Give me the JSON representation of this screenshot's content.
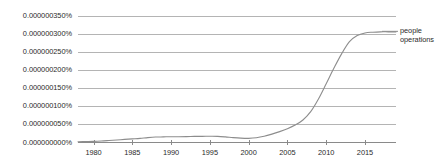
{
  "chart_data": {
    "type": "line",
    "title": "",
    "subtitle": "",
    "xlabel": "",
    "ylabel": "",
    "grid": true,
    "legend_position": "right-inline",
    "xlim": [
      1978,
      2019
    ],
    "ylim": [
      0.0,
      3.5e-07
    ],
    "x_ticks": [
      1980,
      1985,
      1990,
      1995,
      2000,
      2005,
      2010,
      2015
    ],
    "x_tick_labels": [
      "1980",
      "1985",
      "1990",
      "1995",
      "2000",
      "2005",
      "2010",
      "2015"
    ],
    "y_ticks": [
      0.0,
      5e-08,
      1e-07,
      1.5e-07,
      2e-07,
      2.5e-07,
      3e-07,
      3.5e-07
    ],
    "y_tick_labels": [
      "0.000000000%",
      "0.000000050%",
      "0.000000100%",
      "0.000000150%",
      "0.000000200%",
      "0.000000250%",
      "0.000000300%",
      "0.000000350%"
    ],
    "series": [
      {
        "name": "people operations",
        "color": "#8d8d8d",
        "x": [
          1978,
          1979,
          1980,
          1981,
          1982,
          1983,
          1984,
          1985,
          1986,
          1987,
          1988,
          1989,
          1990,
          1991,
          1992,
          1993,
          1994,
          1995,
          1996,
          1997,
          1998,
          1999,
          2000,
          2001,
          2002,
          2003,
          2004,
          2005,
          2006,
          2007,
          2008,
          2009,
          2010,
          2011,
          2012,
          2013,
          2014,
          2015,
          2016,
          2017,
          2018,
          2019
        ],
        "values": [
          2e-09,
          2.5e-09,
          3e-09,
          4e-09,
          5.5e-09,
          7e-09,
          8.5e-09,
          1e-08,
          1.15e-08,
          1.35e-08,
          1.5e-08,
          1.55e-08,
          1.6e-08,
          1.6e-08,
          1.62e-08,
          1.68e-08,
          1.7e-08,
          1.72e-08,
          1.7e-08,
          1.55e-08,
          1.35e-08,
          1.2e-08,
          1.15e-08,
          1.3e-08,
          1.7e-08,
          2.3e-08,
          3e-08,
          3.8e-08,
          4.8e-08,
          6.2e-08,
          8.5e-08,
          1.2e-07,
          1.62e-07,
          2.05e-07,
          2.45e-07,
          2.78e-07,
          2.95e-07,
          3.02e-07,
          3.04e-07,
          3.05e-07,
          3.05e-07,
          3.05e-07
        ]
      }
    ],
    "annotations": [
      {
        "name": "series-end-label",
        "text_lines": [
          "people",
          "operations"
        ],
        "target_series": "people operations"
      }
    ],
    "colors": {
      "background": "#ffffff",
      "grid": "#b4b4b4",
      "axis": "#8a8a8a",
      "text": "#2b2b2b",
      "series": "#8d8d8d"
    }
  },
  "legend": {
    "people_operations_line1": "people",
    "people_operations_line2": "operations"
  }
}
